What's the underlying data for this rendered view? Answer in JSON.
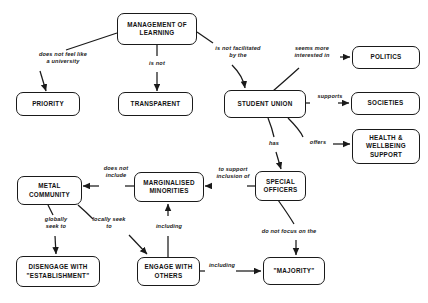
{
  "diagram": {
    "stroke_color": "#1a1a1a",
    "background_color": "#ffffff",
    "nodes": [
      {
        "id": "management-of-learning",
        "label": "MANAGEMENT OF\nLEARNING"
      },
      {
        "id": "priority",
        "label": "PRIORITY"
      },
      {
        "id": "transparent",
        "label": "TRANSPARENT"
      },
      {
        "id": "student-union",
        "label": "STUDENT UNION"
      },
      {
        "id": "politics",
        "label": "POLITICS"
      },
      {
        "id": "societies",
        "label": "SOCIETIES"
      },
      {
        "id": "health-wellbeing-support",
        "label": "HEALTH &\nWELLBEING\nSUPPORT"
      },
      {
        "id": "metal-community",
        "label": "METAL\nCOMMUNITY"
      },
      {
        "id": "marginalised-minorities",
        "label": "MARGINALISED\nMINORITIES"
      },
      {
        "id": "special-officers",
        "label": "SPECIAL\nOFFICERS"
      },
      {
        "id": "disengage-with-establishment",
        "label": "DISENGAGE WITH\n\"ESTABLISHMENT\""
      },
      {
        "id": "engage-with-others",
        "label": "ENGAGE WITH\nOTHERS"
      },
      {
        "id": "majority",
        "label": "\"MAJORITY\""
      }
    ],
    "edge_labels": [
      {
        "id": "does-not-feel-like-a-university",
        "text": "does not feel like\na university"
      },
      {
        "id": "is-not",
        "text": "is not"
      },
      {
        "id": "is-not-facilitated-by-the",
        "text": "is not facilitated\nby the"
      },
      {
        "id": "seems-more-interested-in",
        "text": "seems more\ninterested in"
      },
      {
        "id": "supports",
        "text": "supports"
      },
      {
        "id": "offers",
        "text": "offers"
      },
      {
        "id": "has",
        "text": "has"
      },
      {
        "id": "to-support-inclusion-of",
        "text": "to support\ninclusion of"
      },
      {
        "id": "does-not-include",
        "text": "does not\ninclude"
      },
      {
        "id": "globally-seek-to",
        "text": "globally\nseek to"
      },
      {
        "id": "locally-seek-to",
        "text": "locally seek\nto"
      },
      {
        "id": "including-minorities",
        "text": "including"
      },
      {
        "id": "do-not-focus-on-the",
        "text": "do not focus on the"
      },
      {
        "id": "including-majority",
        "text": "including"
      }
    ]
  }
}
